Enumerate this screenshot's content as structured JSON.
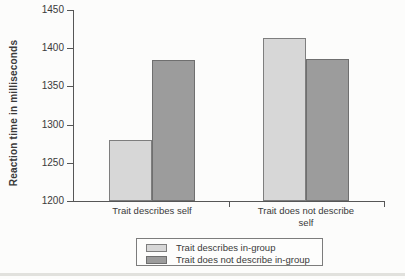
{
  "chart_data": {
    "type": "bar",
    "title": "",
    "ylabel": "Reaction time in milliseconds",
    "xlabel": "",
    "categories": [
      "Trait describes self",
      "Trait does not describe self"
    ],
    "series": [
      {
        "name": "Trait describes in-group",
        "color": "#d7d7d7",
        "border_color": "#7e7e7e",
        "values": [
          1280,
          1413
        ]
      },
      {
        "name": "Trait does not describe in-group",
        "color": "#9c9c9c",
        "border_color": "#6f6f6f",
        "values": [
          1385,
          1386
        ]
      }
    ],
    "ylim": [
      1200,
      1450
    ],
    "yticks": [
      1450,
      1400,
      1350,
      1300,
      1250,
      1200
    ],
    "grid": false,
    "legend_position": "bottom-center",
    "axis_color": "#565656",
    "text_color": "#3a3a3a"
  }
}
